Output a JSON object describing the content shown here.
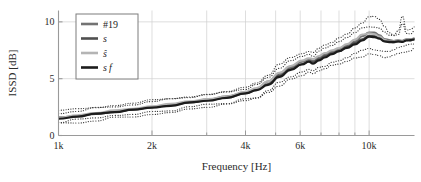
{
  "figure": {
    "background": "#ffffff",
    "frame_color": "#9a9a9a",
    "grid_color": "#d0d0d0"
  },
  "axes": {
    "ylabel": "ISSD [dB]",
    "xlabel": "Frequency [Hz]",
    "y_ticks": [
      "0",
      "5",
      "10"
    ],
    "y_tick_values": [
      0,
      5,
      10
    ],
    "x_ticks": [
      "1k",
      "2k",
      "4k",
      "6k",
      "10k"
    ],
    "x_tick_values": [
      1000,
      2000,
      4000,
      6000,
      10000
    ],
    "xlim": [
      1000,
      14000
    ],
    "ylim": [
      0,
      11
    ],
    "xscale": "log",
    "grid": true
  },
  "legend": {
    "position": "top-left",
    "border_color": "#7d7d7d",
    "entries": [
      {
        "label": "#19",
        "color": "#737373",
        "style": "solid",
        "italic": false
      },
      {
        "label": "s",
        "color": "#4f4f4f",
        "style": "solid",
        "italic": true
      },
      {
        "label": "ŝ",
        "color": "#b4b4b4",
        "style": "solid",
        "italic": true
      },
      {
        "label": "s f",
        "color": "#1c1c1c",
        "style": "solid",
        "italic": true
      }
    ]
  },
  "chart_data": {
    "type": "line",
    "title": "",
    "xlabel": "Frequency [Hz]",
    "ylabel": "ISSD [dB]",
    "xscale": "log",
    "xlim": [
      1000,
      14000
    ],
    "ylim": [
      0,
      11
    ],
    "grid": true,
    "legend_position": "top-left",
    "x": [
      1000,
      1150,
      1320,
      1520,
      1740,
      2000,
      2300,
      2640,
      3030,
      3480,
      4000,
      4350,
      4730,
      5140,
      5590,
      6080,
      6400,
      6600,
      6900,
      7200,
      7600,
      8000,
      8500,
      9000,
      9500,
      10000,
      10400,
      10800,
      11200,
      11600,
      12000,
      12400,
      12800,
      13200,
      13600,
      14000
    ],
    "series": [
      {
        "name": "#19",
        "color": "#737373",
        "style": "solid",
        "width": 2.1,
        "values": [
          1.55,
          1.75,
          1.95,
          2.12,
          2.3,
          2.5,
          2.72,
          2.95,
          3.15,
          3.4,
          3.75,
          4.1,
          4.7,
          5.4,
          6.0,
          6.45,
          6.7,
          6.55,
          6.85,
          7.1,
          7.35,
          7.6,
          7.95,
          8.3,
          8.75,
          9.05,
          9.1,
          8.85,
          8.5,
          8.35,
          8.3,
          8.4,
          8.35,
          8.5,
          8.45,
          8.5
        ]
      },
      {
        "name": "s",
        "color": "#4f4f4f",
        "style": "solid",
        "width": 2.0,
        "values": [
          1.5,
          1.7,
          1.9,
          2.08,
          2.26,
          2.46,
          2.68,
          2.9,
          3.12,
          3.36,
          3.7,
          4.0,
          4.55,
          5.25,
          5.85,
          6.3,
          6.55,
          6.4,
          6.7,
          6.95,
          7.2,
          7.45,
          7.8,
          8.1,
          8.5,
          8.75,
          8.8,
          8.6,
          8.35,
          8.25,
          8.2,
          8.3,
          8.3,
          8.4,
          8.4,
          8.45
        ]
      },
      {
        "name": "ŝ",
        "color": "#b4b4b4",
        "style": "solid",
        "width": 2.0,
        "values": [
          1.6,
          1.8,
          2.0,
          2.18,
          2.36,
          2.56,
          2.78,
          3.0,
          3.2,
          3.45,
          3.8,
          4.15,
          4.8,
          5.5,
          6.1,
          6.55,
          6.8,
          6.7,
          7.0,
          7.25,
          7.5,
          7.75,
          8.1,
          8.45,
          8.85,
          9.0,
          8.95,
          8.7,
          8.4,
          8.3,
          8.25,
          8.35,
          8.3,
          8.45,
          8.4,
          8.45
        ]
      },
      {
        "name": "s f",
        "color": "#1c1c1c",
        "style": "solid",
        "width": 2.2,
        "values": [
          1.48,
          1.68,
          1.88,
          2.05,
          2.24,
          2.44,
          2.65,
          2.88,
          3.1,
          3.34,
          3.68,
          3.98,
          4.5,
          5.2,
          5.8,
          6.25,
          6.5,
          6.35,
          6.65,
          6.9,
          7.15,
          7.4,
          7.75,
          8.05,
          8.4,
          8.65,
          8.7,
          8.5,
          8.3,
          8.2,
          8.18,
          8.28,
          8.28,
          8.38,
          8.38,
          8.42
        ]
      },
      {
        "name": "upper-bound-1",
        "color": "#3a3a3a",
        "style": "dotted",
        "width": 1.2,
        "values": [
          2.15,
          2.35,
          2.55,
          2.72,
          2.9,
          3.05,
          3.25,
          3.45,
          3.6,
          3.85,
          4.2,
          4.6,
          5.4,
          6.3,
          6.9,
          7.25,
          7.4,
          7.35,
          7.6,
          7.9,
          8.2,
          8.5,
          8.95,
          9.4,
          9.9,
          10.35,
          10.5,
          10.2,
          9.6,
          9.1,
          8.85,
          9.1,
          10.6,
          9.2,
          9.3,
          9.5
        ]
      },
      {
        "name": "upper-bound-2",
        "color": "#3a3a3a",
        "style": "dotted",
        "width": 1.2,
        "values": [
          2.0,
          2.2,
          2.4,
          2.58,
          2.76,
          2.95,
          3.15,
          3.35,
          3.52,
          3.75,
          4.05,
          4.4,
          5.1,
          5.95,
          6.55,
          6.95,
          7.15,
          7.05,
          7.35,
          7.6,
          7.9,
          8.2,
          8.6,
          9.0,
          9.4,
          9.6,
          9.6,
          9.35,
          9.0,
          8.8,
          8.7,
          8.85,
          9.8,
          8.95,
          9.0,
          9.15
        ]
      },
      {
        "name": "lower-bound-1",
        "color": "#3a3a3a",
        "style": "dotted",
        "width": 1.2,
        "values": [
          1.05,
          1.2,
          1.38,
          1.55,
          1.72,
          1.9,
          2.1,
          2.3,
          2.5,
          2.72,
          3.0,
          3.25,
          3.7,
          4.35,
          4.9,
          5.3,
          5.5,
          5.4,
          5.6,
          5.85,
          6.1,
          6.35,
          6.6,
          6.8,
          7.0,
          7.1,
          7.05,
          6.95,
          6.9,
          6.95,
          7.05,
          7.2,
          7.3,
          7.45,
          7.5,
          7.6
        ]
      },
      {
        "name": "lower-bound-2",
        "color": "#3a3a3a",
        "style": "dotted",
        "width": 1.2,
        "values": [
          1.2,
          1.36,
          1.54,
          1.7,
          1.88,
          2.06,
          2.26,
          2.46,
          2.66,
          2.88,
          3.15,
          3.4,
          3.95,
          4.6,
          5.15,
          5.55,
          5.75,
          5.65,
          5.9,
          6.15,
          6.4,
          6.65,
          6.95,
          7.2,
          7.45,
          7.6,
          7.6,
          7.5,
          7.45,
          7.5,
          7.6,
          7.75,
          7.85,
          7.95,
          8.0,
          8.1
        ]
      }
    ]
  }
}
